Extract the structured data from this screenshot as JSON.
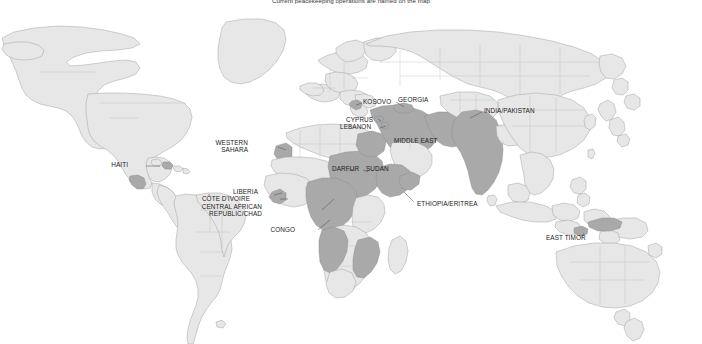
{
  "caption": "Current peacekeeping operations are named on the map",
  "colors": {
    "background": "#ffffff",
    "land": "#e7e7e7",
    "land_border": "#9b9b9b",
    "highlight": "#a9a9a9",
    "highlight_border": "#8a8a8a",
    "label_text": "#1c1c1c",
    "leader_line": "#4a4a4a"
  },
  "map": {
    "title": "World map of current peacekeeping operations",
    "projection": "equirectangular",
    "legend_note": "Darker shaded countries host current peacekeeping operations",
    "labels": [
      {
        "id": "haiti",
        "text": "HAITI",
        "x": 129,
        "y": 165,
        "align": "left",
        "lines": [
          "HAITI"
        ]
      },
      {
        "id": "western-sahara",
        "text": "WESTERN SAHARA",
        "x": 248,
        "y": 143,
        "align": "left",
        "lines": [
          "WESTERN",
          "SAHARA"
        ]
      },
      {
        "id": "liberia",
        "text": "LIBERIA",
        "x": 258,
        "y": 192,
        "align": "left",
        "lines": [
          "LIBERIA"
        ]
      },
      {
        "id": "cote-divoire",
        "text": "CÔTE D'IVOIRE",
        "x": 249,
        "y": 199,
        "align": "left",
        "lines": [
          "CÔTE D'IVOIRE"
        ]
      },
      {
        "id": "car-chad",
        "text": "CENTRAL AFRICAN REPUBLIC/CHAD",
        "x": 262,
        "y": 206,
        "align": "left",
        "lines": [
          "CENTRAL AFRICAN",
          "REPUBLIC/CHAD"
        ]
      },
      {
        "id": "congo",
        "text": "CONGO",
        "x": 295,
        "y": 228,
        "align": "left",
        "lines": [
          "CONGO"
        ]
      },
      {
        "id": "darfur",
        "text": "DARFUR",
        "x": 332,
        "y": 168,
        "align": "left",
        "lines": [
          "DARFUR"
        ]
      },
      {
        "id": "sudan",
        "text": "SUDAN",
        "x": 366,
        "y": 168,
        "align": "left",
        "lines": [
          "SUDAN"
        ]
      },
      {
        "id": "ethiopia-eritrea",
        "text": "ETHIOPIA/ERITREA",
        "x": 417,
        "y": 203,
        "align": "left",
        "lines": [
          "ETHIOPIA/ERITREA"
        ]
      },
      {
        "id": "cyprus",
        "text": "CYPRUS",
        "x": 359,
        "y": 119,
        "align": "left",
        "lines": [
          "CYPRUS"
        ]
      },
      {
        "id": "lebanon",
        "text": "LEBANON",
        "x": 348,
        "y": 126,
        "align": "left",
        "lines": [
          "LEBANON"
        ]
      },
      {
        "id": "kosovo",
        "text": "KOSOVO",
        "x": 363,
        "y": 101,
        "align": "left",
        "lines": [
          "KOSOVO"
        ]
      },
      {
        "id": "georgia",
        "text": "GEORGIA",
        "x": 398,
        "y": 99,
        "align": "left",
        "lines": [
          "GEORGIA"
        ]
      },
      {
        "id": "middle-east",
        "text": "MIDDLE EAST",
        "x": 394,
        "y": 140,
        "align": "left",
        "lines": [
          "MIDDLE EAST"
        ]
      },
      {
        "id": "india-pakistan",
        "text": "INDIA/PAKISTAN",
        "x": 484,
        "y": 110,
        "align": "left",
        "lines": [
          "INDIA/PAKISTAN"
        ]
      },
      {
        "id": "east-timor",
        "text": "EAST TIMOR",
        "x": 546,
        "y": 237,
        "align": "left",
        "lines": [
          "EAST TIMOR"
        ]
      }
    ],
    "highlighted_regions": [
      "Haiti",
      "Western Sahara",
      "Liberia",
      "Côte d'Ivoire",
      "Central African Republic",
      "Chad",
      "Democratic Republic of the Congo",
      "Sudan",
      "Darfur",
      "Ethiopia",
      "Eritrea",
      "Cyprus",
      "Lebanon",
      "Kosovo",
      "Georgia",
      "Middle East",
      "India",
      "Pakistan",
      "East Timor",
      "Guatemala",
      "Mozambique",
      "Zimbabwe",
      "Angola",
      "Namibia"
    ]
  }
}
